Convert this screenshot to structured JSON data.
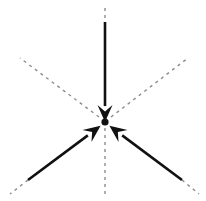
{
  "figure": {
    "type": "vector-diagram",
    "width": 206,
    "height": 201,
    "background_color": "#ffffff",
    "solid_color": "#111111",
    "dashed_color": "#8d8d8d",
    "origin": {
      "x": 105,
      "y": 122
    },
    "symmetry": "bilateral about the vertical axis",
    "angular_separation_deg": 120
  },
  "chart_data": {
    "type": "scatter",
    "xlabel": "",
    "ylabel": "",
    "origin": {
      "x": 105,
      "y": 122
    },
    "vectors": [
      {
        "name": "vector-top",
        "label": "down arrow from top",
        "style": "solid",
        "color": "#111111",
        "direction": "downward",
        "angle_deg": 270,
        "tail": {
          "x": 105,
          "y": 22
        },
        "head": {
          "x": 105,
          "y": 120
        },
        "length_px": 98,
        "arrowhead": true,
        "stroke_width": 2.6
      },
      {
        "name": "vector-lower-left",
        "label": "up-right arrow from lower left",
        "style": "solid",
        "color": "#111111",
        "direction": "upper-right",
        "angle_deg": 30,
        "tail": {
          "x": 28,
          "y": 180
        },
        "head": {
          "x": 99,
          "y": 127
        },
        "length_px": 88,
        "arrowhead": true,
        "stroke_width": 2.6
      },
      {
        "name": "vector-lower-right",
        "label": "up-left arrow from lower right",
        "style": "solid",
        "color": "#111111",
        "direction": "upper-left",
        "angle_deg": 150,
        "tail": {
          "x": 182,
          "y": 180
        },
        "head": {
          "x": 111,
          "y": 127
        },
        "length_px": 88,
        "arrowhead": true,
        "stroke_width": 2.6
      }
    ],
    "axis_lines": [
      {
        "name": "axis-vertical-upper",
        "label": "vertical construction line above origin",
        "style": "dashed",
        "color": "#8d8d8d",
        "from": {
          "x": 105,
          "y": 8
        },
        "to": {
          "x": 105,
          "y": 22
        },
        "dash_pattern": "3,4",
        "stroke_width": 1.4
      },
      {
        "name": "axis-vertical-lower",
        "label": "vertical construction line below origin",
        "style": "dashed",
        "color": "#8d8d8d",
        "from": {
          "x": 105,
          "y": 128
        },
        "to": {
          "x": 105,
          "y": 196
        },
        "dash_pattern": "3,4",
        "stroke_width": 1.4
      },
      {
        "name": "axis-upper-left",
        "label": "upper-left construction line",
        "style": "dashed",
        "color": "#8d8d8d",
        "from": {
          "x": 99,
          "y": 117
        },
        "to": {
          "x": 20,
          "y": 58
        },
        "dash_pattern": "3,4",
        "stroke_width": 1.4
      },
      {
        "name": "axis-upper-right",
        "label": "upper-right construction line",
        "style": "dashed",
        "color": "#8d8d8d",
        "from": {
          "x": 111,
          "y": 117
        },
        "to": {
          "x": 188,
          "y": 58
        },
        "dash_pattern": "3,4",
        "stroke_width": 1.4
      },
      {
        "name": "axis-lower-left-extension",
        "label": "lower-left construction line beyond arrow tail",
        "style": "dashed",
        "color": "#8d8d8d",
        "from": {
          "x": 28,
          "y": 180
        },
        "to": {
          "x": 10,
          "y": 194
        },
        "dash_pattern": "3,4",
        "stroke_width": 1.4
      },
      {
        "name": "axis-lower-right-extension",
        "label": "lower-right construction line beyond arrow tail",
        "style": "dashed",
        "color": "#8d8d8d",
        "from": {
          "x": 182,
          "y": 180
        },
        "to": {
          "x": 199,
          "y": 194
        },
        "dash_pattern": "3,4",
        "stroke_width": 1.4
      }
    ],
    "legend": [],
    "grid": false,
    "annotations": []
  }
}
